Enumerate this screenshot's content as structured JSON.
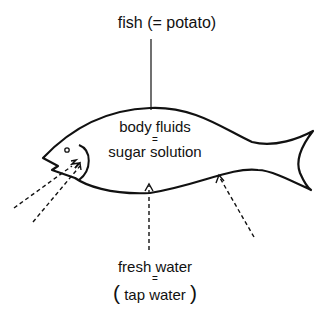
{
  "diagram": {
    "title": "fish (= potato)",
    "body_label": {
      "line1": "body fluids",
      "equals": "=",
      "line2": "sugar solution"
    },
    "water_label": {
      "line1": "fresh water",
      "equals": "=",
      "open_paren": "(",
      "line2": "tap water",
      "close_paren": ")"
    },
    "arrows": [
      {
        "name": "arrow-mouth-upper",
        "style": "dashed"
      },
      {
        "name": "arrow-mouth-lower",
        "style": "dashed"
      },
      {
        "name": "arrow-belly-center",
        "style": "dashed"
      },
      {
        "name": "arrow-belly-right",
        "style": "dashed"
      }
    ],
    "colors": {
      "stroke": "#111111",
      "background": "#ffffff"
    }
  }
}
